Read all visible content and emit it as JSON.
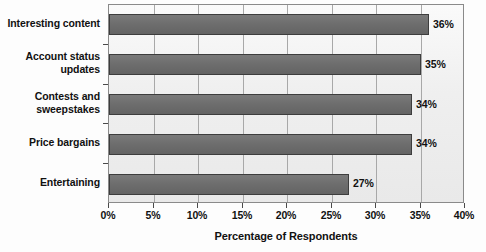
{
  "chart_data": {
    "type": "bar",
    "orientation": "horizontal",
    "title": "",
    "xlabel": "Percentage of Respondents",
    "ylabel": "",
    "categories": [
      "Interesting content",
      "Account status updates",
      "Contests and sweepstakes",
      "Price bargains",
      "Entertaining"
    ],
    "values": [
      36,
      35,
      34,
      34,
      27
    ],
    "value_labels": [
      "36%",
      "35%",
      "34%",
      "34%",
      "27%"
    ],
    "xlim": [
      0,
      40
    ],
    "xticks": [
      0,
      5,
      10,
      15,
      20,
      25,
      30,
      35,
      40
    ],
    "xtick_labels": [
      "0%",
      "5%",
      "10%",
      "15%",
      "20%",
      "25%",
      "30%",
      "35%",
      "40%"
    ],
    "grid": "vertical",
    "legend": null,
    "colors": {
      "bar_fill": "#6f6f6f",
      "bar_border": "#3d3d3d",
      "plot_background": "#f2f2f2",
      "plot_border": "#8a8a8a",
      "gridline": "#a8a8a8",
      "text": "#111111",
      "page_background": "#ffffff"
    }
  },
  "category_label_lines": [
    [
      "Interesting content"
    ],
    [
      "Account status",
      "updates"
    ],
    [
      "Contests and",
      "sweepstakes"
    ],
    [
      "Price bargains"
    ],
    [
      "Entertaining"
    ]
  ]
}
